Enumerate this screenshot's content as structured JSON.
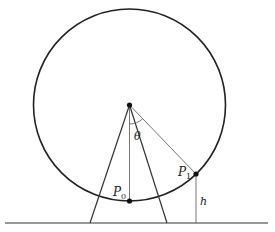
{
  "diagram": {
    "labels": {
      "theta": "θ",
      "p0_main": "P",
      "p0_sub": "0",
      "p1_main": "P",
      "p1_sub": "1",
      "h": "h"
    },
    "geometry": {
      "center": [
        129.5,
        105
      ],
      "radius": 96,
      "p0": [
        129.5,
        201
      ],
      "p1": [
        196,
        174
      ],
      "ground_y": 223,
      "ground_x": [
        5,
        268
      ],
      "legs": [
        [
          129.5,
          105,
          90,
          223
        ],
        [
          129.5,
          105,
          167,
          223
        ]
      ]
    },
    "colors": {
      "stroke": "#222222",
      "thin_stroke": "#555555"
    }
  }
}
